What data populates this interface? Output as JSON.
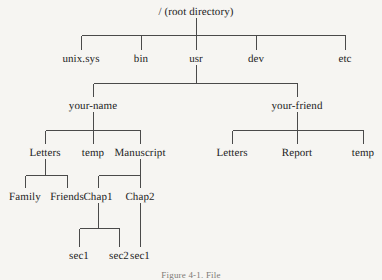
{
  "figure": {
    "caption": "Figure 4-1.  File",
    "background_color": "#f6f5f2",
    "line_color": "#4a4a4a",
    "text_color": "#232323"
  },
  "tree": {
    "root": {
      "label": "/ (root directory)"
    },
    "level2": [
      {
        "label": "unix.sys"
      },
      {
        "label": "bin"
      },
      {
        "label": "usr"
      },
      {
        "label": "dev"
      },
      {
        "label": "etc"
      }
    ],
    "level3": [
      {
        "label": "your-name"
      },
      {
        "label": "your-friend"
      }
    ],
    "your_name_children": [
      {
        "label": "Letters"
      },
      {
        "label": "temp"
      },
      {
        "label": "Manuscript"
      }
    ],
    "your_friend_children": [
      {
        "label": "Letters"
      },
      {
        "label": "Report"
      },
      {
        "label": "temp"
      }
    ],
    "letters_children": [
      {
        "label": "Family"
      },
      {
        "label": "Friends"
      }
    ],
    "manuscript_children": [
      {
        "label": "Chap1"
      },
      {
        "label": "Chap2"
      }
    ],
    "chap1_children": [
      {
        "label": "sec1"
      },
      {
        "label": "sec2"
      }
    ],
    "chap2_children": [
      {
        "label": "sec1"
      }
    ]
  }
}
